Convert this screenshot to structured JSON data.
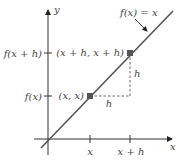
{
  "diagram": {
    "function_label": "f(x) = x",
    "axis_labels": {
      "x": "x",
      "y": "y"
    },
    "y_ticks": [
      {
        "label": "f(x + h)"
      },
      {
        "label": "f(x)"
      }
    ],
    "x_ticks": [
      {
        "label": "x"
      },
      {
        "label": "x + h"
      }
    ],
    "points": [
      {
        "label": "(x, x)"
      },
      {
        "label": "(x + h, x + h)"
      }
    ],
    "increment_labels": {
      "horizontal": "h",
      "vertical": "h"
    },
    "colors": {
      "line": "#555555",
      "point": "#555555",
      "axis": "#333333",
      "text": "#444444"
    }
  }
}
